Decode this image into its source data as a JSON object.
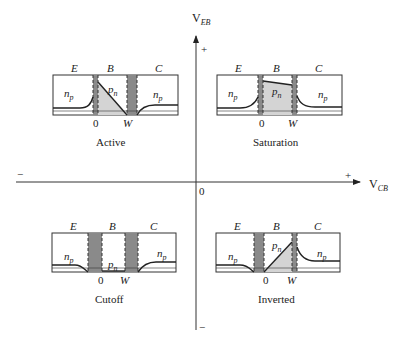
{
  "axes": {
    "vertical_label": "V",
    "vertical_sub": "EB",
    "horizontal_label": "V",
    "horizontal_sub": "CB",
    "origin": "0",
    "v_plus": "+",
    "v_minus": "−",
    "h_plus": "+",
    "h_minus": "−"
  },
  "panels": [
    {
      "name": "active",
      "caption": "Active",
      "regions": [
        "E",
        "B",
        "C"
      ],
      "ticks": [
        "0",
        "W"
      ],
      "left_carrier": "n",
      "left_sub": "p",
      "base_carrier": "p",
      "base_sub": "n",
      "right_carrier": "n",
      "right_sub": "p"
    },
    {
      "name": "saturation",
      "caption": "Saturation",
      "regions": [
        "E",
        "B",
        "C"
      ],
      "ticks": [
        "0",
        "W"
      ],
      "left_carrier": "n",
      "left_sub": "p",
      "base_carrier": "p",
      "base_sub": "n",
      "right_carrier": "n",
      "right_sub": "p"
    },
    {
      "name": "cutoff",
      "caption": "Cutoff",
      "regions": [
        "E",
        "B",
        "C"
      ],
      "ticks": [
        "0",
        "W"
      ],
      "left_carrier": "n",
      "left_sub": "p",
      "base_carrier": "p",
      "base_sub": "n",
      "right_carrier": "n",
      "right_sub": "p"
    },
    {
      "name": "inverted",
      "caption": "Inverted",
      "regions": [
        "E",
        "B",
        "C"
      ],
      "ticks": [
        "0",
        "W"
      ],
      "left_carrier": "n",
      "left_sub": "p",
      "base_carrier": "p",
      "base_sub": "n",
      "right_carrier": "n",
      "right_sub": "p"
    }
  ],
  "colors": {
    "depletion": "#8a8a8a",
    "base_fill": "#d4d4d4",
    "line": "#222222"
  }
}
